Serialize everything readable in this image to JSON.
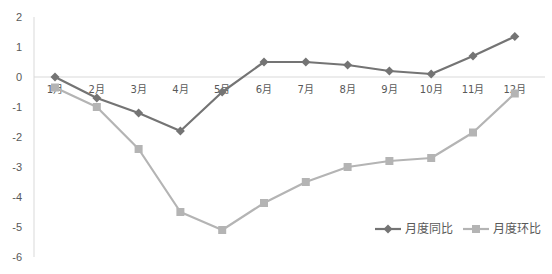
{
  "chart_data": {
    "type": "line",
    "title": "",
    "xlabel": "",
    "ylabel": "",
    "categories": [
      "1月",
      "2月",
      "3月",
      "4月",
      "5月",
      "6月",
      "7月",
      "8月",
      "9月",
      "10月",
      "11月",
      "12月"
    ],
    "series": [
      {
        "name": "月度同比",
        "color": "#747474",
        "marker": "diamond",
        "values": [
          0,
          -0.7,
          -1.2,
          -1.8,
          -0.5,
          0.5,
          0.5,
          0.4,
          0.2,
          0.1,
          0.7,
          1.35
        ]
      },
      {
        "name": "月度环比",
        "color": "#b4b4b4",
        "marker": "square",
        "values": [
          -0.35,
          -1.0,
          -2.4,
          -4.5,
          -5.1,
          -4.2,
          -3.5,
          -3.0,
          -2.8,
          -2.7,
          -1.85,
          -0.55
        ]
      }
    ],
    "ylim": [
      -6,
      2
    ],
    "yticks": [
      2,
      1,
      0,
      -1,
      -2,
      -3,
      -4,
      -5,
      -6
    ],
    "grid": false,
    "legend_position": "bottom-right"
  }
}
